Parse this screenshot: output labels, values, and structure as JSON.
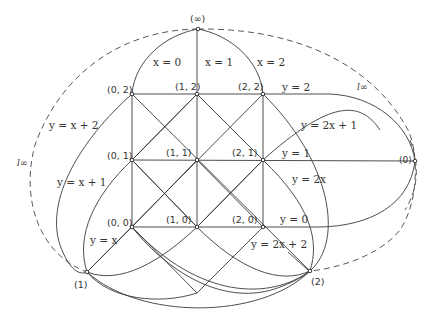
{
  "figure": {
    "colors": {
      "stroke": "#3a3a3a",
      "text": "#333333",
      "background": "#ffffff"
    }
  },
  "points": {
    "grid": [
      {
        "label": "(0, 2)"
      },
      {
        "label": "(1, 2)"
      },
      {
        "label": "(2, 2)"
      },
      {
        "label": "(0, 1)"
      },
      {
        "label": "(1, 1)"
      },
      {
        "label": "(2, 1)"
      },
      {
        "label": "(0, 0)"
      },
      {
        "label": "(1, 0)"
      },
      {
        "label": "(2, 0)"
      }
    ],
    "infinity": [
      {
        "label": "(∞)"
      },
      {
        "label": "(0)"
      },
      {
        "label": "(1)"
      },
      {
        "label": "(2)"
      }
    ]
  },
  "lines": {
    "vertical": [
      "x = 0",
      "x = 1",
      "x = 2"
    ],
    "horizontal": [
      "y = 2",
      "y = 1",
      "y = 0"
    ],
    "slope1": [
      "y = x + 2",
      "y = x + 1",
      "y = x"
    ],
    "slope2": [
      "y = 2x + 1",
      "y = 2x",
      "y = 2x + 2"
    ],
    "at_infinity": [
      "l∞",
      "l∞"
    ]
  }
}
